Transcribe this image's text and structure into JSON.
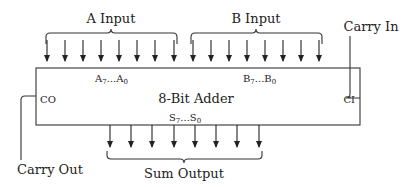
{
  "diagram": {
    "title": "8-Bit Adder",
    "inputs": {
      "a": {
        "label": "A Input",
        "bus_label_main": "A",
        "bus_hi": "7",
        "bus_mid": "...A",
        "bus_lo": "0",
        "bits": 8
      },
      "b": {
        "label": "B Input",
        "bus_label_main": "B",
        "bus_hi": "7",
        "bus_mid": "...B",
        "bus_lo": "0",
        "bits": 8
      },
      "carry_in": {
        "label": "Carry In",
        "pin": "CI"
      }
    },
    "outputs": {
      "sum": {
        "label": "Sum Output",
        "bus_label_main": "S",
        "bus_hi": "7",
        "bus_mid": "...S",
        "bus_lo": "0",
        "bits": 8
      },
      "carry_out": {
        "label": "Carry Out",
        "pin": "CO"
      }
    },
    "colors": {
      "line": "#333333",
      "background": "#ffffff"
    }
  }
}
